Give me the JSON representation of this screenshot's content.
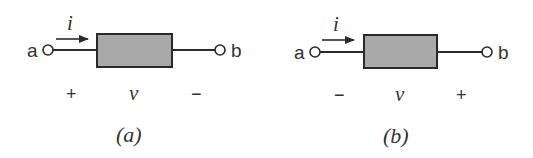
{
  "colors": {
    "stroke": "#2a2a2a",
    "box_fill": "#a9a9a9",
    "text": "#333333",
    "background": "#ffffff"
  },
  "diagrams": [
    {
      "caption": "(a)",
      "terminal_left": "a",
      "terminal_right": "b",
      "current_label": "i",
      "voltage_label": "v",
      "sign_left": "+",
      "sign_right": "−"
    },
    {
      "caption": "(b)",
      "terminal_left": "a",
      "terminal_right": "b",
      "current_label": "i",
      "voltage_label": "v",
      "sign_left": "−",
      "sign_right": "+"
    }
  ]
}
